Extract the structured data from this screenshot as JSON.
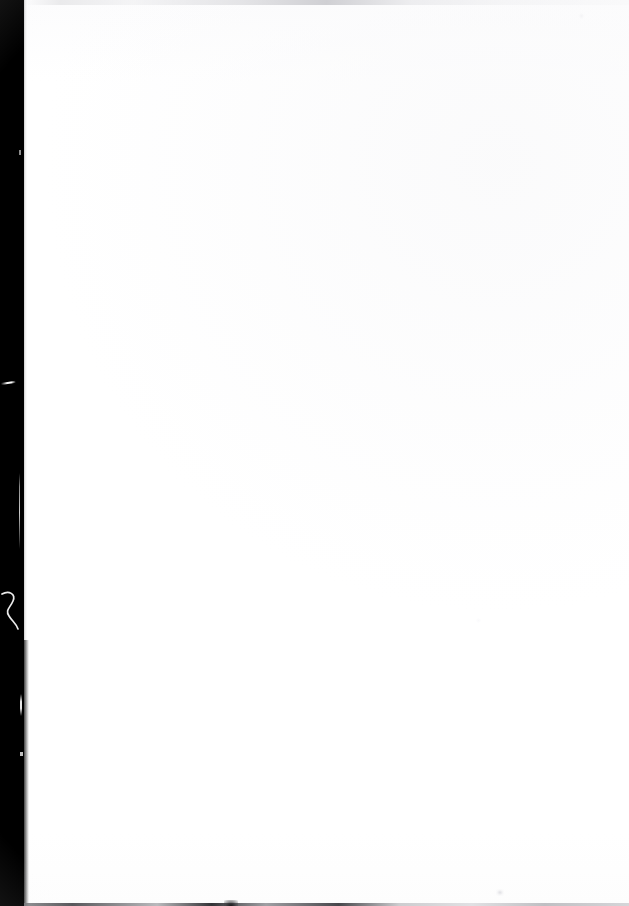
{
  "document": {
    "page_label": "",
    "body_text": "",
    "is_blank": true,
    "description": "Blank scanned page"
  },
  "scan": {
    "page_width_px": 629,
    "page_height_px": 906,
    "paper_color": "#ffffff",
    "gutter_color": "#000000",
    "gutter_width_px": 24,
    "gutter_side": "left",
    "bottom_edge_color": "#3a3a3e",
    "top_smudge_color": "#cdcdd1"
  },
  "artifacts": {
    "diagonal_scratch_label": "",
    "vertical_hairline_label": "",
    "squiggle_label": "",
    "sliver_label": "",
    "notch_label": "",
    "tick_label": "",
    "top_speck_label": "",
    "bottom_blob_label": "",
    "bottom_speck_label": "",
    "page_speck_label": ""
  }
}
